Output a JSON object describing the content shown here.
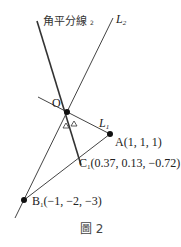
{
  "figure": {
    "caption": "圖 2",
    "labels": {
      "bisector": "角平分線",
      "bisector_sub": "2",
      "L2": "L",
      "L2_sub": "2",
      "L1": "L",
      "L1_sub": "1",
      "O": "O",
      "A": "A(1, 1, 1)",
      "C1_letter": "C",
      "C1_sub": "1",
      "C1_coords": "(0.37, 0.13, −0.72)",
      "B1_letter": "B",
      "B1_sub": "1",
      "B1_coords": "(−1, −2, −3)",
      "angle_mark": "Δ"
    },
    "points": {
      "O": [
        67,
        112
      ],
      "A": [
        110,
        134
      ],
      "B1": [
        24,
        200
      ],
      "C1": [
        81,
        165
      ]
    },
    "colors": {
      "line": "#333333",
      "point": "#111111"
    }
  }
}
